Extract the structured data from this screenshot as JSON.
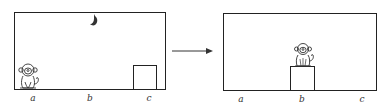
{
  "figure": {
    "left_panel": {
      "labels": [
        "a",
        "b",
        "c"
      ],
      "objects": [
        "banana",
        "monkey",
        "box"
      ],
      "monkey_position": "a",
      "box_position": "c"
    },
    "right_panel": {
      "labels": [
        "a",
        "b",
        "c"
      ],
      "objects": [
        "monkey",
        "box"
      ],
      "monkey_position": "on box",
      "box_position": "b"
    },
    "arrow": "transition"
  }
}
